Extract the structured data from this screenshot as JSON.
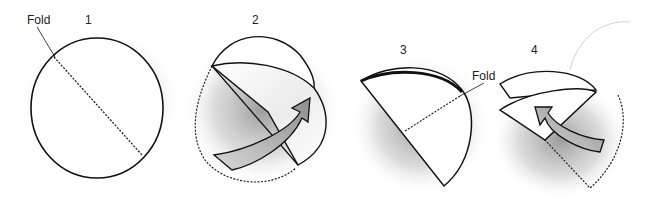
{
  "diagram": {
    "steps": [
      {
        "number": "1",
        "fold_label": "Fold"
      },
      {
        "number": "2"
      },
      {
        "number": "3",
        "fold_label": "Fold"
      },
      {
        "number": "4"
      }
    ]
  },
  "colors": {
    "line": "#111111",
    "shadow": "#9a9a9a",
    "arrow_fill": "#b8b8b8",
    "background": "#ffffff"
  }
}
